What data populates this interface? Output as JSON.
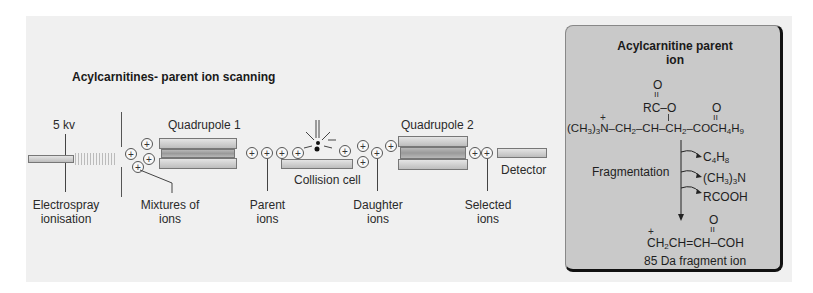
{
  "diagram": {
    "title": "Acylcarnitines- parent ion scanning",
    "voltage": "5 kv",
    "components": {
      "quadrupole1": "Quadrupole 1",
      "quadrupole2": "Quadrupole 2",
      "collision_cell": "Collision cell",
      "detector": "Detector"
    },
    "labels": {
      "electrospray_l1": "Electrospray",
      "electrospray_l2": "ionisation",
      "mixtures_l1": "Mixtures of",
      "mixtures_l2": "ions",
      "parent_l1": "Parent",
      "parent_l2": "ions",
      "daughter_l1": "Daughter",
      "daughter_l2": "ions",
      "selected_l1": "Selected",
      "selected_l2": "ions"
    },
    "ion_symbol": "+"
  },
  "panel": {
    "title_l1": "Acylcarnitine parent",
    "title_l2": "ion",
    "structure": {
      "carbonyl_o_top": "O",
      "double_bond": "=",
      "rc_o": "RC–O",
      "ester_o": "O",
      "main_chain": "(CH3)3N–CH2–CH–CH2–COCH4H9"
    },
    "fragmentation_label": "Fragmentation",
    "losses": [
      "C4H8",
      "(CH3)3N",
      "RCOOH"
    ],
    "product": {
      "o_top": "O",
      "formula": "CH2CH=CH–COH",
      "caption": "85 Da fragment ion"
    }
  },
  "colors": {
    "background": "#f0f0f0",
    "panel_bg": "#c9c9c9",
    "panel_border": "#111111",
    "rod": "#c8c8c8"
  }
}
